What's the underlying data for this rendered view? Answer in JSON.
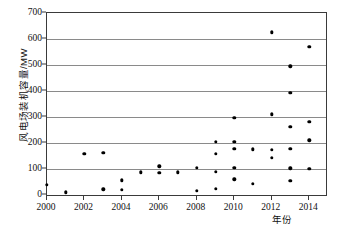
{
  "chart_data": {
    "type": "scatter",
    "title": "",
    "xlabel": "年份",
    "ylabel": "风电场装机容量/MW",
    "xlim": [
      2000,
      2014.9
    ],
    "ylim": [
      0,
      700
    ],
    "grid": true,
    "legend": false,
    "xticks": [
      2000,
      2002,
      2004,
      2006,
      2008,
      2010,
      2012,
      2014
    ],
    "xtick_labels": [
      "2000",
      "2002",
      "2004",
      "2006",
      "2008",
      "2010",
      "2012",
      "2014"
    ],
    "yticks": [
      0,
      100,
      200,
      300,
      400,
      500,
      600,
      700
    ],
    "ytick_labels": [
      "0",
      "100",
      "200",
      "300",
      "400",
      "500",
      "600",
      "700"
    ],
    "marker": "filled-circle",
    "marker_color": "#000000",
    "grid_color": "#8a8a8a",
    "frame_color": "#3a3a3a",
    "points": [
      {
        "x": 2000,
        "y": 40
      },
      {
        "x": 2001,
        "y": 10
      },
      {
        "x": 2002,
        "y": 158
      },
      {
        "x": 2003,
        "y": 163
      },
      {
        "x": 2003,
        "y": 22
      },
      {
        "x": 2004,
        "y": 57
      },
      {
        "x": 2004,
        "y": 21
      },
      {
        "x": 2005,
        "y": 88
      },
      {
        "x": 2006,
        "y": 111
      },
      {
        "x": 2006,
        "y": 85
      },
      {
        "x": 2007,
        "y": 88
      },
      {
        "x": 2008,
        "y": 105
      },
      {
        "x": 2008,
        "y": 15
      },
      {
        "x": 2009,
        "y": 205
      },
      {
        "x": 2009,
        "y": 159
      },
      {
        "x": 2009,
        "y": 90
      },
      {
        "x": 2009,
        "y": 23
      },
      {
        "x": 2010,
        "y": 297
      },
      {
        "x": 2010,
        "y": 204
      },
      {
        "x": 2010,
        "y": 178
      },
      {
        "x": 2010,
        "y": 104
      },
      {
        "x": 2010,
        "y": 60
      },
      {
        "x": 2011,
        "y": 176
      },
      {
        "x": 2011,
        "y": 43
      },
      {
        "x": 2012,
        "y": 626
      },
      {
        "x": 2012,
        "y": 310
      },
      {
        "x": 2012,
        "y": 175
      },
      {
        "x": 2012,
        "y": 144
      },
      {
        "x": 2013,
        "y": 495
      },
      {
        "x": 2013,
        "y": 393
      },
      {
        "x": 2013,
        "y": 263
      },
      {
        "x": 2013,
        "y": 178
      },
      {
        "x": 2013,
        "y": 103
      },
      {
        "x": 2013,
        "y": 54
      },
      {
        "x": 2014,
        "y": 570
      },
      {
        "x": 2014,
        "y": 282
      },
      {
        "x": 2014,
        "y": 210
      },
      {
        "x": 2014,
        "y": 100
      }
    ]
  }
}
